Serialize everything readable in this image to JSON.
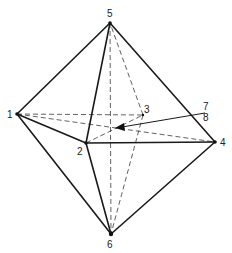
{
  "diagram": {
    "type": "octahedron",
    "vertices": [
      {
        "id": "1",
        "label": "1",
        "x": 17,
        "y": 114
      },
      {
        "id": "2",
        "label": "2",
        "x": 86,
        "y": 143
      },
      {
        "id": "3",
        "label": "3",
        "x": 143,
        "y": 115
      },
      {
        "id": "4",
        "label": "4",
        "x": 215,
        "y": 142
      },
      {
        "id": "5",
        "label": "5",
        "x": 110,
        "y": 23
      },
      {
        "id": "6",
        "label": "6",
        "x": 111,
        "y": 234
      }
    ],
    "solid_edges": [
      [
        "1",
        "5"
      ],
      [
        "5",
        "2"
      ],
      [
        "5",
        "4"
      ],
      [
        "1",
        "2"
      ],
      [
        "2",
        "4"
      ],
      [
        "1",
        "6"
      ],
      [
        "2",
        "6"
      ],
      [
        "4",
        "6"
      ]
    ],
    "hidden_edges": [
      [
        "1",
        "3"
      ],
      [
        "1",
        "4"
      ],
      [
        "2",
        "3"
      ],
      [
        "3",
        "5"
      ],
      [
        "3",
        "6"
      ],
      [
        "5",
        "6"
      ]
    ],
    "pointer_labels": [
      {
        "id": "7",
        "label": "7"
      },
      {
        "id": "8",
        "label": "8"
      }
    ],
    "arrow": {
      "from": [
        205,
        113
      ],
      "to": [
        116,
        128
      ]
    }
  }
}
